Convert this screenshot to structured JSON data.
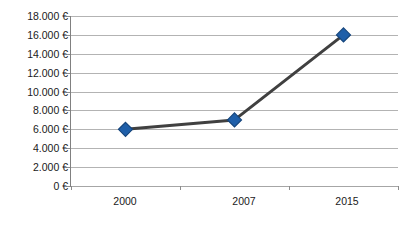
{
  "chart_data": {
    "type": "line",
    "title": "",
    "xlabel": "",
    "ylabel": "",
    "categories": [
      "2000",
      "2007",
      "2015"
    ],
    "values": [
      6000,
      7000,
      16000
    ],
    "series": [
      {
        "name": "",
        "values": [
          6000,
          7000,
          16000
        ],
        "marker": "diamond",
        "marker_color": "#1f5fa9",
        "marker_border_color": "#15457c",
        "line_color": "#404040"
      }
    ],
    "ylim": [
      0,
      18000
    ],
    "ytick_step": 2000,
    "ytick_labels": [
      "18.000 €",
      "16.000 €",
      "14.000 €",
      "12.000 €",
      "10.000 €",
      "8.000 €",
      "6.000 €",
      "4.000 €",
      "2.000 €",
      "0 €"
    ],
    "ytick_values": [
      18000,
      16000,
      14000,
      12000,
      10000,
      8000,
      6000,
      4000,
      2000,
      0
    ],
    "xtick_labels": [
      "2000",
      "2007",
      "2015"
    ],
    "currency_symbol": "€",
    "number_format": "de-DE",
    "grid": "horizontal",
    "legend": "none",
    "background_color": "#ffffff",
    "gridline_color": "#b3b3b3",
    "axis_color": "#808080",
    "text_color": "#1a1a1a"
  }
}
